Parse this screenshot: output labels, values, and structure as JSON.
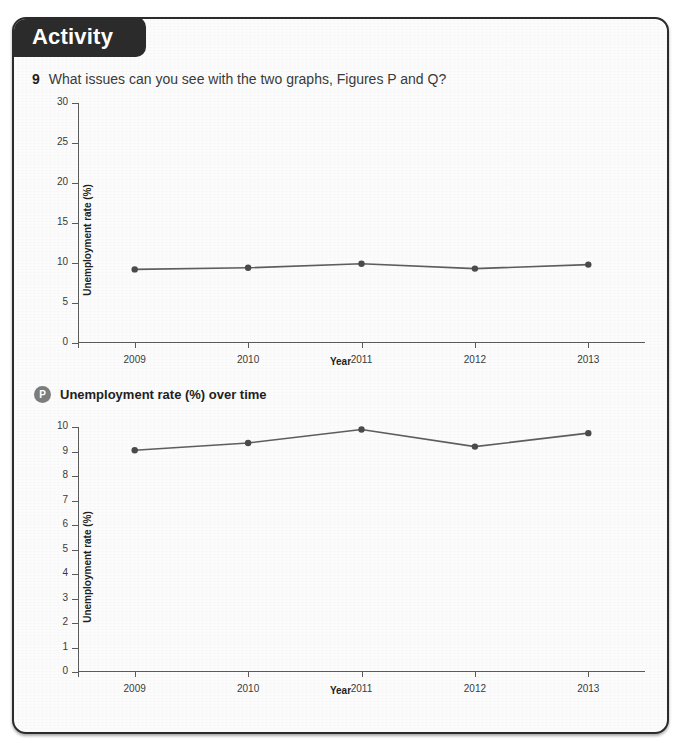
{
  "panel": {
    "tab_label": "Activity"
  },
  "question": {
    "number": "9",
    "text": "What issues can you see with the two graphs, Figures P and Q?"
  },
  "captions": {
    "p": {
      "badge": "P",
      "text": "Unemployment rate (%) over time"
    },
    "q": {
      "badge": "Q",
      "text": "Employment data"
    }
  },
  "colors": {
    "panel_border": "#2b2b2b",
    "tab_background": "#2b2b2b",
    "tab_text": "#ffffff",
    "axis": "#5a5a5a",
    "series_line": "#5d5d5d",
    "series_marker": "#4a4a4a",
    "badge_background": "#7d7d7d"
  },
  "chart_data": [
    {
      "id": "figure-p",
      "type": "line",
      "title": "Unemployment rate (%) over time",
      "xlabel": "Year",
      "ylabel": "Unemployment rate (%)",
      "categories": [
        "2009",
        "2010",
        "2011",
        "2012",
        "2013"
      ],
      "values": [
        9.2,
        9.4,
        9.9,
        9.3,
        9.8
      ],
      "ylim": [
        0,
        30
      ],
      "yticks": [
        0,
        5,
        10,
        15,
        20,
        25,
        30
      ],
      "grid": false,
      "legend": "none",
      "note": "Y axis scale 0-30 exaggerates the plot area and flattens the data"
    },
    {
      "id": "figure-q",
      "type": "line",
      "title": "Employment data",
      "xlabel": "Year",
      "ylabel": "Unemployment rate (%)",
      "categories": [
        "2009",
        "2010",
        "2011",
        "2012",
        "2013"
      ],
      "values": [
        9.05,
        9.35,
        9.9,
        9.2,
        9.75
      ],
      "ylim": [
        0,
        10
      ],
      "yticks": [
        0,
        1,
        2,
        3,
        4,
        5,
        6,
        7,
        8,
        9,
        10
      ],
      "grid": false,
      "legend": "none",
      "note": "Y axis scale 0-10 makes the same data appear to vary more"
    }
  ]
}
